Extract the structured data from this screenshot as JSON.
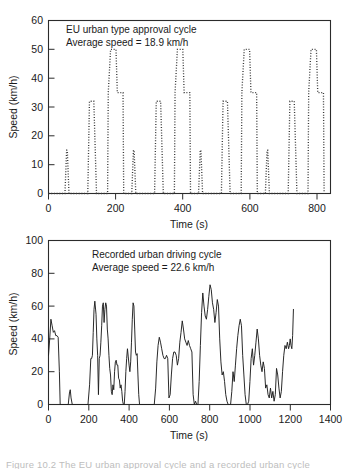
{
  "figure": {
    "caption": "Figure 10.2  The EU urban approval cycle and a recorded urban cycle"
  },
  "chart_data": [
    {
      "id": "eu-urban-type-approval-cycle",
      "type": "line",
      "line_style": "dotted",
      "title": "",
      "annotation_line1": "EU urban type approval cycle",
      "annotation_line2": "Average speed = 18.9 km/h",
      "xlabel": "Time (s)",
      "ylabel": "Speed (km/h)",
      "xlim": [
        0,
        840
      ],
      "ylim": [
        0,
        60
      ],
      "xticks": [
        0,
        200,
        400,
        600,
        800
      ],
      "yticks": [
        0,
        10,
        20,
        30,
        40,
        50,
        60
      ],
      "grid": false,
      "legend": "none",
      "average_speed_kmh": 18.9,
      "series": [
        {
          "name": "ECE-15 urban cycle speed",
          "x": [
            0,
            11,
            15,
            23,
            25,
            28,
            49,
            54,
            56,
            61,
            85,
            96,
            117,
            122,
            124,
            133,
            135,
            143,
            155,
            163,
            176,
            178,
            185,
            188,
            195,
            201,
            205,
            217,
            222,
            224,
            227,
            248,
            253,
            255,
            260,
            284,
            295,
            316,
            321,
            323,
            332,
            334,
            342,
            354,
            362,
            375,
            377,
            384,
            387,
            394,
            400,
            404,
            416,
            421,
            423,
            426,
            447,
            452,
            454,
            459,
            483,
            494,
            515,
            520,
            522,
            531,
            533,
            541,
            553,
            561,
            574,
            576,
            583,
            586,
            593,
            599,
            603,
            615,
            620,
            622,
            625,
            646,
            651,
            653,
            658,
            682,
            693,
            714,
            719,
            721,
            730,
            732,
            740,
            752,
            760,
            773,
            775,
            782,
            785,
            792,
            798,
            802,
            814,
            819,
            821
          ],
          "y": [
            0,
            0,
            0,
            0,
            0,
            0,
            0,
            15,
            15,
            0,
            0,
            0,
            0,
            32,
            32,
            32,
            32,
            0,
            0,
            0,
            0,
            35,
            50,
            50,
            50,
            50,
            35,
            35,
            35,
            0,
            0,
            0,
            15,
            15,
            0,
            0,
            0,
            0,
            32,
            32,
            32,
            32,
            0,
            0,
            0,
            0,
            35,
            50,
            50,
            50,
            50,
            35,
            35,
            35,
            0,
            0,
            0,
            15,
            15,
            0,
            0,
            0,
            0,
            32,
            32,
            32,
            32,
            0,
            0,
            0,
            0,
            35,
            50,
            50,
            50,
            50,
            35,
            35,
            35,
            0,
            0,
            0,
            15,
            15,
            0,
            0,
            0,
            0,
            32,
            32,
            32,
            32,
            0,
            0,
            0,
            0,
            35,
            50,
            50,
            50,
            50,
            35,
            35,
            35,
            0,
            0
          ]
        }
      ]
    },
    {
      "id": "recorded-urban-driving-cycle",
      "type": "line",
      "line_style": "solid",
      "title": "",
      "annotation_line1": "Recorded urban driving cycle",
      "annotation_line2": "Average speed = 22.6 km/h",
      "xlabel": "Time (s)",
      "ylabel": "Speed (km/h)",
      "xlim": [
        0,
        1400
      ],
      "ylim": [
        0,
        100
      ],
      "xticks": [
        0,
        200,
        400,
        600,
        800,
        1000,
        1200,
        1400
      ],
      "yticks": [
        0,
        20,
        40,
        60,
        80,
        100
      ],
      "grid": false,
      "legend": "none",
      "average_speed_kmh": 22.6,
      "peak_speed_kmh": 82,
      "series": [
        {
          "name": "Recorded vehicle speed",
          "x": [
            0,
            6,
            12,
            18,
            24,
            30,
            36,
            42,
            48,
            54,
            58,
            62,
            70,
            80,
            90,
            98,
            104,
            108,
            112,
            118,
            126,
            140,
            160,
            180,
            196,
            204,
            210,
            214,
            218,
            222,
            226,
            230,
            236,
            240,
            244,
            248,
            252,
            256,
            260,
            264,
            268,
            272,
            276,
            280,
            284,
            288,
            292,
            296,
            300,
            304,
            308,
            312,
            316,
            320,
            324,
            328,
            332,
            336,
            340,
            344,
            348,
            352,
            356,
            360,
            364,
            368,
            372,
            376,
            380,
            384,
            388,
            392,
            396,
            400,
            404,
            408,
            412,
            416,
            420,
            424,
            428,
            432,
            436,
            440,
            444,
            448,
            452,
            456,
            470,
            490,
            510,
            525,
            532,
            538,
            544,
            550,
            556,
            562,
            568,
            574,
            580,
            586,
            592,
            598,
            604,
            610,
            616,
            622,
            628,
            634,
            640,
            646,
            652,
            658,
            664,
            670,
            676,
            682,
            688,
            694,
            700,
            706,
            712,
            718,
            724,
            730,
            736,
            742,
            748,
            754,
            760,
            766,
            772,
            778,
            784,
            790,
            796,
            802,
            808,
            814,
            820,
            826,
            832,
            838,
            844,
            850,
            856,
            862,
            868,
            874,
            880,
            886,
            892,
            898,
            904,
            910,
            916,
            922,
            928,
            934,
            940,
            946,
            952,
            958,
            964,
            970,
            976,
            982,
            988,
            994,
            1000,
            1006,
            1012,
            1018,
            1024,
            1030,
            1036,
            1042,
            1048,
            1054,
            1060,
            1066,
            1072,
            1078,
            1084,
            1090,
            1096,
            1102,
            1108,
            1114,
            1120,
            1126,
            1132,
            1138,
            1144,
            1150,
            1156,
            1162,
            1168,
            1174,
            1180,
            1186,
            1192,
            1196,
            1200,
            1204,
            1208,
            1212,
            1216
          ],
          "y": [
            30,
            40,
            52,
            48,
            44,
            45,
            42,
            42,
            41,
            20,
            0,
            0,
            0,
            0,
            0,
            0,
            7,
            9,
            4,
            0,
            0,
            0,
            0,
            0,
            0,
            12,
            28,
            28,
            30,
            44,
            58,
            63,
            55,
            40,
            30,
            6,
            28,
            30,
            38,
            48,
            60,
            62,
            50,
            58,
            62,
            60,
            46,
            40,
            30,
            22,
            18,
            8,
            6,
            12,
            9,
            20,
            26,
            27,
            24,
            24,
            16,
            15,
            10,
            12,
            8,
            2,
            0,
            0,
            8,
            20,
            28,
            34,
            29,
            24,
            20,
            26,
            38,
            52,
            62,
            60,
            46,
            32,
            30,
            31,
            18,
            6,
            0,
            0,
            0,
            0,
            0,
            0,
            10,
            26,
            36,
            41,
            38,
            34,
            30,
            28,
            28,
            30,
            28,
            4,
            6,
            18,
            28,
            32,
            32,
            30,
            24,
            28,
            38,
            44,
            51,
            46,
            40,
            38,
            36,
            39,
            36,
            34,
            32,
            6,
            0,
            2,
            0,
            0,
            14,
            36,
            56,
            68,
            60,
            54,
            52,
            58,
            66,
            73,
            70,
            62,
            58,
            50,
            56,
            64,
            60,
            40,
            26,
            18,
            20,
            14,
            6,
            2,
            0,
            0,
            0,
            8,
            20,
            14,
            24,
            34,
            42,
            48,
            52,
            48,
            30,
            18,
            6,
            0,
            0,
            2,
            14,
            28,
            34,
            24,
            30,
            38,
            46,
            40,
            30,
            24,
            20,
            26,
            22,
            10,
            12,
            6,
            4,
            10,
            4,
            8,
            2,
            6,
            22,
            18,
            10,
            4,
            8,
            20,
            30,
            36,
            34,
            38,
            34,
            36,
            40,
            36,
            34,
            42,
            58,
            74,
            82,
            70,
            40,
            16,
            8,
            17,
            10,
            0
          ]
        }
      ]
    }
  ]
}
